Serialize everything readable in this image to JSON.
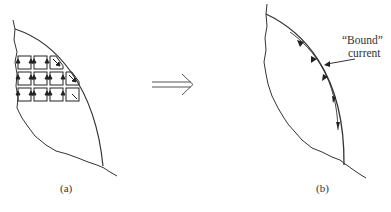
{
  "figure": {
    "panels": [
      {
        "id": "a",
        "label": "(a)",
        "description": "Magnetized slab cross-section with small current loops"
      },
      {
        "id": "b",
        "label": "(b)",
        "description": "Net bound surface current along the edge"
      }
    ],
    "arrow": {
      "symbol": "implies",
      "glyph": "⟹"
    },
    "annotation": {
      "line1": "“Bound”",
      "line2": "current"
    },
    "grid_rows": [
      3,
      4,
      4
    ]
  }
}
